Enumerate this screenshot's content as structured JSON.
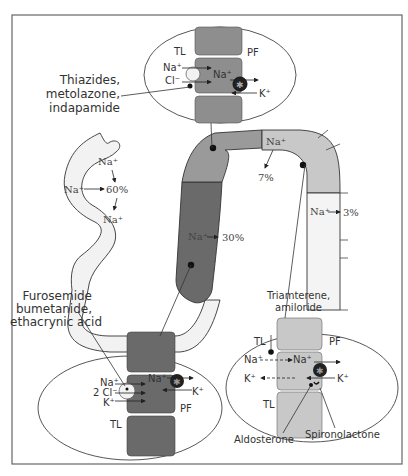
{
  "colors": {
    "frame": "#666666",
    "light_gray": "#c8c8c8",
    "mid_gray": "#8e8e8e",
    "dark_gray": "#6a6a6a",
    "pale": "#f2f2f2",
    "ink": "#222222"
  },
  "top_inset": {
    "tl": "TL",
    "pf": "PF",
    "na_in": "Na⁺",
    "cl_in": "Cl⁻",
    "na_cell": "Na⁺",
    "k": "K⁺",
    "drug_line1": "Thiazides,",
    "drug_line2": "metolazone,",
    "drug_line3": "indapamide"
  },
  "proximal": {
    "na_top": "Na⁺",
    "na_left": "Na⁺",
    "pct": "60%",
    "na_bottom": "Na⁺"
  },
  "loop": {
    "na_thick": "Na⁺",
    "pct_thick": "30%"
  },
  "distal": {
    "na": "Na⁺",
    "pct": "7%"
  },
  "collecting": {
    "na": "Na⁺",
    "pct": "3%"
  },
  "bottom_left_inset": {
    "drug_line1": "Furosemide",
    "drug_line2": "bumetanide,",
    "drug_line3": "ethacrynic acid",
    "na": "Na⁺",
    "cl": "2 Cl⁻",
    "k": "K⁺",
    "na_cell": "Na⁺",
    "k_right": "K⁺",
    "pf": "PF",
    "tl": "TL"
  },
  "bottom_right_inset": {
    "drug_line1": "Triamterene,",
    "drug_line2": "amiloride",
    "tl_top": "TL",
    "pf": "PF",
    "na_left": "Na⁺",
    "na_cell": "Na⁺",
    "k_left": "K⁺",
    "k_right": "K⁺",
    "tl_bottom": "TL",
    "aldosterone": "Aldosterone",
    "spironolactone": "Spironolactone"
  }
}
